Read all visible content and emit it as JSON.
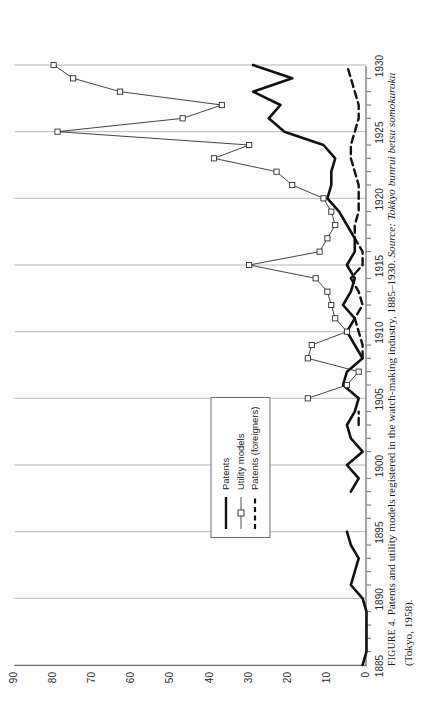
{
  "figure": {
    "label": "FIGURE 4.",
    "caption_main": "Patents and utility models registered in the watch-making industry, 1885–1930.",
    "source_label": "Source:",
    "source_title": "Tokkyo bunrui betsu somokuroku",
    "source_place_year": "(Tokyo, 1958)."
  },
  "legend": {
    "position": "inside-left",
    "items": [
      {
        "label": "Patents",
        "style": "thick-solid",
        "color": "#111111"
      },
      {
        "label": "Utility models",
        "style": "thin-solid-square-markers",
        "color": "#222222"
      },
      {
        "label": "Patents (foreigners)",
        "style": "dashed",
        "color": "#111111"
      }
    ]
  },
  "chart_data": {
    "type": "line",
    "title": "Patents and utility models registered in the watch-making industry, 1885–1930",
    "xlabel": "",
    "ylabel": "",
    "xlim": [
      1885,
      1930
    ],
    "ylim": [
      0,
      90
    ],
    "yticks": [
      0,
      10,
      20,
      30,
      40,
      50,
      60,
      70,
      80,
      90
    ],
    "xticks": [
      1885,
      1890,
      1895,
      1900,
      1905,
      1910,
      1915,
      1920,
      1925,
      1930
    ],
    "minor_xticks_every": 1,
    "grid": "vertical-only",
    "legend_position": "inside-left",
    "x": [
      1885,
      1886,
      1887,
      1888,
      1889,
      1890,
      1891,
      1892,
      1893,
      1894,
      1895,
      1896,
      1897,
      1898,
      1899,
      1900,
      1901,
      1902,
      1903,
      1904,
      1905,
      1906,
      1907,
      1908,
      1909,
      1910,
      1911,
      1912,
      1913,
      1914,
      1915,
      1916,
      1917,
      1918,
      1919,
      1920,
      1921,
      1922,
      1923,
      1924,
      1925,
      1926,
      1927,
      1928,
      1929,
      1930
    ],
    "series": [
      {
        "name": "Patents",
        "style": "thick-solid",
        "values": [
          1,
          0,
          0,
          0,
          0,
          1,
          4,
          3,
          2,
          4,
          5,
          null,
          null,
          4,
          2,
          5,
          1,
          4,
          5,
          3,
          2,
          6,
          5,
          1,
          3,
          5,
          3,
          6,
          4,
          3,
          5,
          3,
          3,
          5,
          7,
          10,
          9,
          9,
          8,
          11,
          21,
          25,
          22,
          29,
          19,
          29
        ]
      },
      {
        "name": "Utility models",
        "style": "thin-solid-square-markers",
        "values": [
          null,
          null,
          null,
          null,
          null,
          null,
          null,
          null,
          null,
          null,
          null,
          null,
          null,
          null,
          null,
          null,
          null,
          null,
          null,
          null,
          15,
          5,
          2,
          15,
          14,
          5,
          8,
          9,
          10,
          13,
          30,
          12,
          10,
          8,
          9,
          11,
          19,
          23,
          39,
          30,
          79,
          47,
          37,
          63,
          75,
          80
        ]
      },
      {
        "name": "Patents (foreigners)",
        "style": "dashed",
        "values": [
          null,
          null,
          null,
          null,
          null,
          null,
          null,
          null,
          null,
          null,
          null,
          null,
          null,
          null,
          null,
          null,
          null,
          null,
          2,
          2,
          null,
          null,
          null,
          1,
          1,
          2,
          3,
          1,
          2,
          4,
          1,
          1,
          3,
          3,
          2,
          2,
          2,
          3,
          4,
          4,
          3,
          2,
          2,
          3,
          4,
          5
        ]
      }
    ]
  },
  "axes": {
    "y_tick_labels": [
      "90",
      "80",
      "70",
      "60",
      "50",
      "40",
      "30",
      "20",
      "10",
      "0"
    ],
    "x_tick_labels": [
      "1885",
      "1890",
      "1895",
      "1900",
      "1905",
      "1910",
      "1915",
      "1920",
      "1925",
      "1930"
    ]
  }
}
